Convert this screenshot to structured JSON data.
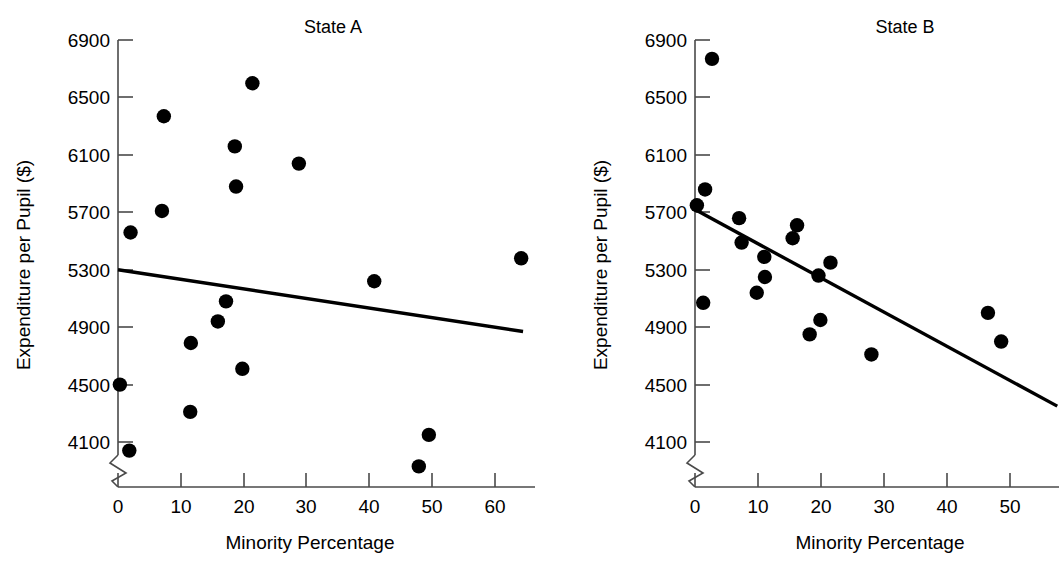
{
  "figure": {
    "kind": "two-panel-scatterplot",
    "background": "#ffffff",
    "ink": "#000000"
  },
  "chart_data": [
    {
      "type": "scatter",
      "title": "State A",
      "xlabel": "Minority Percentage",
      "ylabel": "Expenditure per Pupil ($)",
      "xlim": [
        0,
        66
      ],
      "ylim": [
        3950,
        6900
      ],
      "grid": false,
      "legend": null,
      "axis_break_y": true,
      "xticks": [
        0,
        10,
        20,
        30,
        40,
        50,
        60
      ],
      "xtick_labels": [
        "0",
        "10",
        "20",
        "30",
        "40",
        "50",
        "60"
      ],
      "yticks": [
        4100,
        4500,
        4900,
        5300,
        5700,
        6100,
        6500,
        6900
      ],
      "ytick_labels": [
        "4100",
        "4500",
        "4900",
        "5300",
        "5700",
        "6100",
        "6500",
        "6900"
      ],
      "points": [
        {
          "x": 1.8,
          "y": 4040
        },
        {
          "x": 0.3,
          "y": 4500
        },
        {
          "x": 2.0,
          "y": 5560
        },
        {
          "x": 7.3,
          "y": 6370
        },
        {
          "x": 7.0,
          "y": 5710
        },
        {
          "x": 11.5,
          "y": 4310
        },
        {
          "x": 11.6,
          "y": 4790
        },
        {
          "x": 15.9,
          "y": 4940
        },
        {
          "x": 17.2,
          "y": 5080
        },
        {
          "x": 18.6,
          "y": 6160
        },
        {
          "x": 18.8,
          "y": 5880
        },
        {
          "x": 19.8,
          "y": 4610
        },
        {
          "x": 21.4,
          "y": 6600
        },
        {
          "x": 28.8,
          "y": 6040
        },
        {
          "x": 40.8,
          "y": 5220
        },
        {
          "x": 47.9,
          "y": 3930
        },
        {
          "x": 49.5,
          "y": 4150
        },
        {
          "x": 64.2,
          "y": 5380
        }
      ],
      "fit_line": {
        "x0": 0,
        "y0": 5300,
        "x1": 64.5,
        "y1": 4870
      }
    },
    {
      "type": "scatter",
      "title": "State B",
      "xlabel": "Minority Percentage",
      "ylabel": "Expenditure per Pupil ($)",
      "xlim": [
        0,
        58
      ],
      "ylim": [
        3950,
        6900
      ],
      "grid": false,
      "legend": null,
      "axis_break_y": true,
      "xticks": [
        0,
        10,
        20,
        30,
        40,
        50
      ],
      "xtick_labels": [
        "0",
        "10",
        "20",
        "30",
        "40",
        "50"
      ],
      "yticks": [
        4100,
        4500,
        4900,
        5300,
        5700,
        6100,
        6500,
        6900
      ],
      "ytick_labels": [
        "4100",
        "4500",
        "4900",
        "5300",
        "5700",
        "6100",
        "6500",
        "6900"
      ],
      "points": [
        {
          "x": 2.7,
          "y": 6770
        },
        {
          "x": 1.6,
          "y": 5860
        },
        {
          "x": 0.3,
          "y": 5750
        },
        {
          "x": 1.3,
          "y": 5070
        },
        {
          "x": 7.0,
          "y": 5660
        },
        {
          "x": 7.4,
          "y": 5490
        },
        {
          "x": 9.8,
          "y": 5140
        },
        {
          "x": 11.0,
          "y": 5390
        },
        {
          "x": 11.1,
          "y": 5250
        },
        {
          "x": 15.5,
          "y": 5520
        },
        {
          "x": 16.2,
          "y": 5610
        },
        {
          "x": 18.2,
          "y": 4850
        },
        {
          "x": 19.6,
          "y": 5260
        },
        {
          "x": 19.9,
          "y": 4950
        },
        {
          "x": 21.5,
          "y": 5350
        },
        {
          "x": 28.0,
          "y": 4710
        },
        {
          "x": 46.5,
          "y": 5000
        },
        {
          "x": 48.6,
          "y": 4800
        }
      ],
      "fit_line": {
        "x0": 0,
        "y0": 5720,
        "x1": 57.5,
        "y1": 4350
      }
    }
  ]
}
